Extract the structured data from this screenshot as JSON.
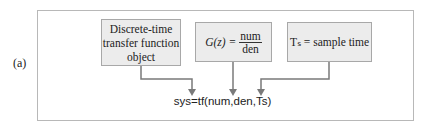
{
  "figure_label": "(a)",
  "boxes": {
    "object": {
      "line1": "Discrete-time",
      "line2": "transfer function",
      "line3": "object"
    },
    "transfer": {
      "lhs": "G(z) =",
      "num": "num",
      "den": "den"
    },
    "sample": {
      "text": "Tₛ = sample time"
    }
  },
  "command": "sys=tf(num,den,Ts)",
  "colors": {
    "box_fill": "#ececec",
    "arrow": "#7a7a7a",
    "frame": "#b8b8b8"
  }
}
